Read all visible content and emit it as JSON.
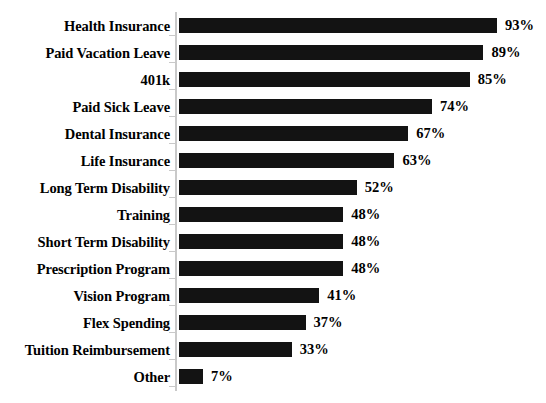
{
  "chart_data": {
    "type": "bar",
    "orientation": "horizontal",
    "title": "",
    "xlabel": "",
    "ylabel": "",
    "xlim": [
      0,
      100
    ],
    "grid": false,
    "legend": false,
    "value_suffix": "%",
    "categories": [
      "Health Insurance",
      "Paid Vacation Leave",
      "401k",
      "Paid Sick Leave",
      "Dental Insurance",
      "Life Insurance",
      "Long Term Disability",
      "Training",
      "Short Term Disability",
      "Prescription Program",
      "Vision Program",
      "Flex Spending",
      "Tuition Reimbursement",
      "Other"
    ],
    "values": [
      93,
      89,
      85,
      74,
      67,
      63,
      52,
      48,
      48,
      48,
      41,
      37,
      33,
      7
    ],
    "data_labels": [
      "93%",
      "89%",
      "85%",
      "74%",
      "67%",
      "63%",
      "52%",
      "48%",
      "48%",
      "48%",
      "41%",
      "37%",
      "33%",
      "7%"
    ],
    "bar_color": "#131313",
    "axis_color": "#c9c9c9",
    "text_color": "#000000",
    "background": "#ffffff"
  }
}
